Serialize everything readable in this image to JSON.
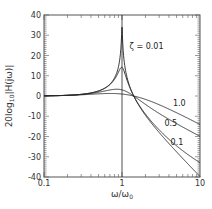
{
  "chart_data": {
    "type": "line",
    "title": "",
    "xlabel": "ω/ω0",
    "xlabel_main": "ω/ω",
    "xlabel_sub": "0",
    "ylabel": "20log10|H(jω)|",
    "ylabel_main": "20log",
    "ylabel_sub": "10",
    "ylabel_rest": "|H(jω)|",
    "xscale": "log",
    "xlim": [
      0.1,
      10
    ],
    "ylim": [
      -40,
      40
    ],
    "x_ticks": [
      {
        "value": 0.1,
        "label": "0.1"
      },
      {
        "value": 1,
        "label": "1"
      },
      {
        "value": 10,
        "label": "10"
      }
    ],
    "y_ticks": [
      {
        "value": 40,
        "label": "40"
      },
      {
        "value": 30,
        "label": "30"
      },
      {
        "value": 20,
        "label": "20"
      },
      {
        "value": 10,
        "label": "10"
      },
      {
        "value": 0,
        "label": "0"
      },
      {
        "value": -10,
        "label": "-10"
      },
      {
        "value": -20,
        "label": "-20"
      },
      {
        "value": -30,
        "label": "-30"
      },
      {
        "value": -40,
        "label": "-40"
      }
    ],
    "grid": false,
    "reference_line": {
      "x": 1,
      "orientation": "vertical"
    },
    "x": [
      0.1,
      0.2,
      0.5,
      0.8,
      1.0,
      1.414,
      2,
      5,
      10
    ],
    "series": [
      {
        "name": "ζ = 0.01",
        "zeta": 0.01,
        "values": [
          0.09,
          0.35,
          2.5,
          8.9,
          34.0,
          0.0,
          -9.5,
          -27.6,
          -39.9
        ],
        "label": "ζ = 0.01"
      },
      {
        "name": "ζ = 0.1",
        "zeta": 0.1,
        "values": [
          0.09,
          0.36,
          2.5,
          8.4,
          14.1,
          0.0,
          -9.1,
          -25.9,
          -32.9
        ],
        "label": "0.1"
      },
      {
        "name": "ζ = 0.5",
        "zeta": 0.5,
        "values": [
          0.08,
          0.32,
          1.7,
          2.9,
          3.0,
          0.0,
          -5.8,
          -13.9,
          -19.9
        ],
        "label": "0.5"
      },
      {
        "name": "ζ = 1.0",
        "zeta": 1.0,
        "values": [
          0.04,
          0.16,
          0.7,
          1.0,
          1.0,
          0.0,
          -3.1,
          -8.3,
          -14.0
        ],
        "label": "1.0"
      }
    ],
    "annotations": [
      {
        "text": "ζ = 0.01",
        "x": 1.25,
        "y": 23
      },
      {
        "text": "1.0",
        "x": 4.5,
        "y": -5
      },
      {
        "text": "0.5",
        "x": 3.5,
        "y": -15
      },
      {
        "text": "0.1",
        "x": 4.2,
        "y": -24
      }
    ],
    "formula": "|H| = |1 + j2ζr| / |1 − r² + j2ζr|, r = ω/ω0"
  },
  "colors": {
    "line": "#222222",
    "frame": "#555555",
    "text": "#333333"
  }
}
